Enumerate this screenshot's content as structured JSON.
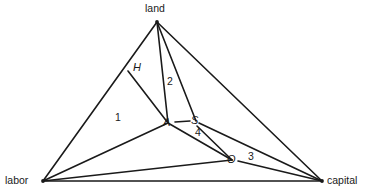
{
  "diagram": {
    "background_color": "#ffffff",
    "line_color": "#1a1a1a",
    "text_color": "#1a1a1a",
    "vertices": [
      {
        "id": "land",
        "label": "land",
        "x": 157,
        "y": 22,
        "label_x": 145,
        "label_y": 3
      },
      {
        "id": "labor",
        "label": "labor",
        "x": 43,
        "y": 181,
        "label_x": 5,
        "label_y": 175
      },
      {
        "id": "capital",
        "label": "capital",
        "x": 322,
        "y": 181,
        "label_x": 327,
        "label_y": 175
      }
    ],
    "nodes": [
      {
        "id": "A",
        "label": "A",
        "x": 168,
        "y": 123,
        "label_x": 163,
        "label_y": 117
      },
      {
        "id": "S",
        "label": "S",
        "x": 196,
        "y": 121,
        "label_x": 191,
        "label_y": 115
      },
      {
        "id": "O",
        "label": "O",
        "x": 232,
        "y": 160,
        "label_x": 227,
        "label_y": 154
      },
      {
        "id": "H",
        "label": "H",
        "x": 128,
        "y": 71,
        "label_x": 133,
        "label_y": 62
      }
    ],
    "region_labels": [
      {
        "id": "1",
        "label": "1",
        "x": 115,
        "y": 112
      },
      {
        "id": "2",
        "label": "2",
        "x": 167,
        "y": 76
      },
      {
        "id": "3",
        "label": "3",
        "x": 248,
        "y": 151
      },
      {
        "id": "4",
        "label": "4",
        "x": 195,
        "y": 127
      }
    ],
    "edges": [
      {
        "id": "land-labor",
        "from": "land",
        "to": "labor",
        "x1": 157,
        "y1": 22,
        "x2": 43,
        "y2": 181
      },
      {
        "id": "land-capital",
        "from": "land",
        "to": "capital",
        "x1": 157,
        "y1": 22,
        "x2": 322,
        "y2": 181
      },
      {
        "id": "labor-capital",
        "from": "labor",
        "to": "capital",
        "x1": 43,
        "y1": 181,
        "x2": 322,
        "y2": 181
      },
      {
        "id": "land-A",
        "from": "land",
        "to": "A",
        "x1": 157,
        "y1": 22,
        "x2": 168,
        "y2": 123
      },
      {
        "id": "land-S",
        "from": "land",
        "to": "S",
        "x1": 157,
        "y1": 22,
        "x2": 196,
        "y2": 121
      },
      {
        "id": "H-A",
        "from": "H",
        "to": "A",
        "x1": 128,
        "y1": 71,
        "x2": 168,
        "y2": 123
      },
      {
        "id": "labor-A",
        "from": "labor",
        "to": "A",
        "x1": 43,
        "y1": 181,
        "x2": 168,
        "y2": 123
      },
      {
        "id": "labor-O",
        "from": "labor",
        "to": "O",
        "x1": 43,
        "y1": 181,
        "x2": 232,
        "y2": 160
      },
      {
        "id": "A-S",
        "from": "A",
        "to": "S",
        "x1": 175,
        "y1": 122,
        "x2": 190,
        "y2": 121
      },
      {
        "id": "A-O",
        "from": "A",
        "to": "O",
        "x1": 168,
        "y1": 123,
        "x2": 232,
        "y2": 160
      },
      {
        "id": "S-O",
        "from": "S",
        "to": "O",
        "x1": 197,
        "y1": 126,
        "x2": 232,
        "y2": 160
      },
      {
        "id": "S-capital",
        "from": "S",
        "to": "capital",
        "x1": 199,
        "y1": 123,
        "x2": 322,
        "y2": 181
      },
      {
        "id": "O-capital",
        "from": "O",
        "to": "capital",
        "x1": 238,
        "y1": 161,
        "x2": 322,
        "y2": 181
      }
    ]
  }
}
